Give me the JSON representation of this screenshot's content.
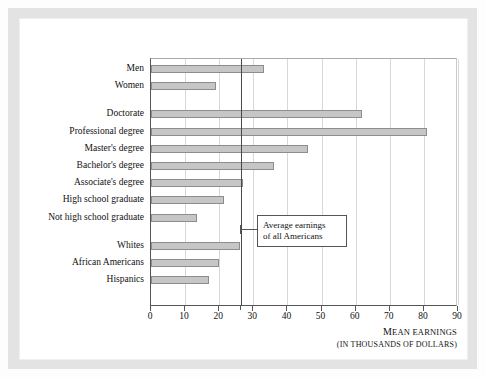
{
  "chart_data": {
    "type": "bar",
    "orientation": "horizontal",
    "title": "",
    "xlabel": "MEAN EARNINGS",
    "xlabel_sub": "(IN THOUSANDS OF DOLLARS)",
    "ylabel": "",
    "xlim": [
      0,
      90
    ],
    "xticks": [
      0,
      10,
      20,
      30,
      40,
      50,
      60,
      70,
      80,
      90
    ],
    "xtick_labels": [
      "0",
      "10",
      "20",
      "30",
      "40",
      "50",
      "60",
      "70",
      "80",
      "90"
    ],
    "grid": true,
    "legend": false,
    "bar_color": "#c6c6c6",
    "bar_edge_color": "#8d8d8d",
    "reference_line": {
      "value": 26.5,
      "label_line1": "Average earnings",
      "label_line2": "of all Americans",
      "color": "#4a4a4a"
    },
    "groups": [
      {
        "name": "sex",
        "categories": [
          "Men",
          "Women"
        ],
        "values": [
          33,
          19
        ]
      },
      {
        "name": "education",
        "categories": [
          "Doctorate",
          "Professional degree",
          "Master's degree",
          "Bachelor's degree",
          "Associate's degree",
          "High school graduate",
          "Not high school graduate"
        ],
        "values": [
          62,
          81,
          46,
          36,
          27,
          21.5,
          13.5
        ]
      },
      {
        "name": "race",
        "categories": [
          "Whites",
          "African Americans",
          "Hispanics"
        ],
        "values": [
          26,
          20,
          17
        ]
      }
    ]
  }
}
